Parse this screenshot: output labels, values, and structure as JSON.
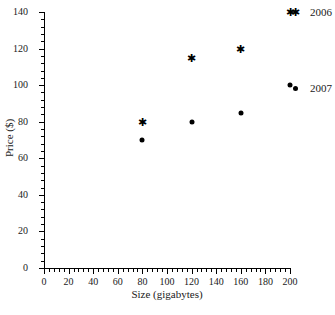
{
  "chart_data": {
    "type": "scatter",
    "title": "",
    "xlabel": "Size (gigabytes)",
    "ylabel": "Price ($)",
    "xlim": [
      0,
      200
    ],
    "ylim": [
      0,
      140
    ],
    "x_ticks": [
      0,
      20,
      40,
      60,
      80,
      100,
      120,
      140,
      160,
      180,
      200
    ],
    "y_ticks": [
      0,
      20,
      40,
      60,
      80,
      100,
      120,
      140
    ],
    "x_minor_per_interval": 4,
    "y_minor_per_interval": 4,
    "grid": false,
    "legend_position": "right",
    "series": [
      {
        "name": "2006",
        "marker": "star",
        "color": "#000000",
        "points": [
          {
            "x": 80,
            "y": 80
          },
          {
            "x": 120,
            "y": 115
          },
          {
            "x": 160,
            "y": 120
          },
          {
            "x": 200,
            "y": 140
          }
        ]
      },
      {
        "name": "2007",
        "marker": "dot",
        "color": "#000000",
        "points": [
          {
            "x": 80,
            "y": 70
          },
          {
            "x": 120,
            "y": 80
          },
          {
            "x": 160,
            "y": 85
          },
          {
            "x": 200,
            "y": 100
          }
        ]
      }
    ]
  },
  "legend": {
    "entries": [
      {
        "label": "2006",
        "marker": "star"
      },
      {
        "label": "2007",
        "marker": "dot"
      }
    ]
  },
  "markers": {
    "star_glyph": "✱"
  }
}
